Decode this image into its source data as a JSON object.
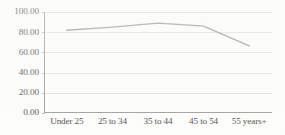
{
  "chart_data": {
    "type": "line",
    "title": "",
    "subtitle": "",
    "xlabel": "",
    "ylabel": "",
    "categories": [
      "Under 25",
      "25 to 34",
      "35 to 44",
      "45 to 54",
      "55 years+"
    ],
    "values": [
      82.0,
      85.0,
      89.0,
      86.0,
      66.5
    ],
    "series": [
      {
        "name": "",
        "values": [
          82.0,
          85.0,
          89.0,
          86.0,
          66.5
        ]
      }
    ],
    "ylim": [
      0,
      100
    ],
    "y_ticks": [
      0,
      20,
      40,
      60,
      80,
      100
    ],
    "y_tick_labels": [
      "0.00",
      "20.00",
      "40.00",
      "60.00",
      "80.00",
      "100.00"
    ],
    "grid": true,
    "grid_axis": "y",
    "legend": false,
    "legend_position": "none",
    "markers": false,
    "annotations": []
  },
  "style": {
    "line_color": "#8a8f96",
    "grid_color": "#d6d6d6",
    "axis_color": "#8e8e8e",
    "text_color": "#2e2e2e",
    "background": "#fdfdfc"
  }
}
